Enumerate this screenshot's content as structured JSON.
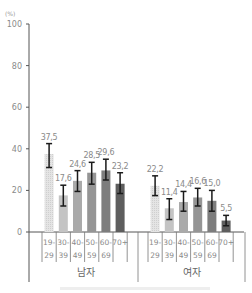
{
  "chart_data": {
    "type": "bar",
    "title": "",
    "unit_label": "(%)",
    "xlabel": "",
    "ylabel": "(%)",
    "ylim": [
      0,
      100
    ],
    "yticks": [
      0,
      20,
      40,
      60,
      80,
      100
    ],
    "grid": false,
    "legend": "none",
    "error_bars": true,
    "categories": [
      "19-29",
      "30-39",
      "40-49",
      "50-59",
      "60-69",
      "70+"
    ],
    "category_lines": [
      [
        "19-",
        "29"
      ],
      [
        "30-",
        "39"
      ],
      [
        "40-",
        "49"
      ],
      [
        "50-",
        "59"
      ],
      [
        "60-",
        "69"
      ],
      [
        "70+",
        ""
      ]
    ],
    "groups": [
      {
        "name": "남자",
        "values": [
          37.5,
          17.6,
          24.6,
          28.5,
          29.6,
          23.2
        ],
        "labels": [
          "37,5",
          "17,6",
          "24,6",
          "28,5",
          "29,6",
          "23,2"
        ],
        "error_low": [
          31.0,
          12.5,
          19.5,
          23.0,
          25.0,
          18.5
        ],
        "error_high": [
          42.5,
          22.5,
          29.5,
          33.5,
          35.0,
          28.5
        ]
      },
      {
        "name": "여자",
        "values": [
          22.2,
          11.4,
          14.4,
          16.6,
          15.0,
          5.5
        ],
        "labels": [
          "22,2",
          "11,4",
          "14,4",
          "16,6",
          "15,0",
          "5,5"
        ],
        "error_low": [
          17.5,
          6.0,
          10.0,
          12.5,
          10.0,
          3.0
        ],
        "error_high": [
          27.0,
          16.0,
          19.5,
          21.0,
          20.0,
          8.0
        ]
      }
    ],
    "bar_colors": [
      "#d9d9d9",
      "#c4c4c4",
      "#aaaaaa",
      "#959595",
      "#7d7d7d",
      "#5e5e5e"
    ]
  }
}
